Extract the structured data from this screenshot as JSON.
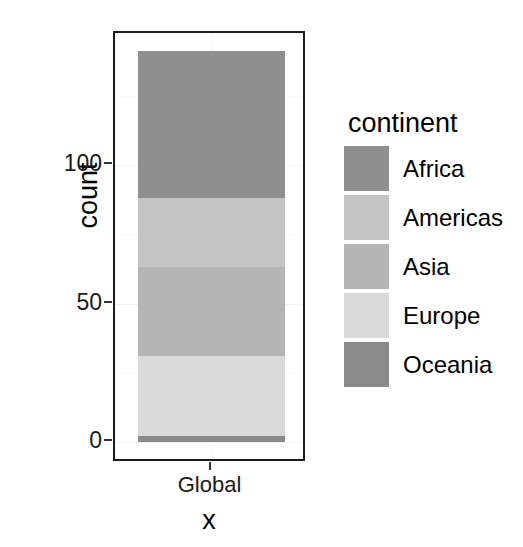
{
  "chart_data": {
    "type": "bar",
    "subtype": "stacked-bar",
    "title": "",
    "subtitle": "",
    "xlabel": "x",
    "ylabel": "count",
    "categories": [
      "Global"
    ],
    "xtick_labels": [
      "Global"
    ],
    "ytick_labels": [
      "0",
      "50",
      "100"
    ],
    "ytick_values": [
      0,
      50,
      100
    ],
    "ylim": [
      0,
      155
    ],
    "xlim_categories": 1,
    "grid": true,
    "grid_major_values": [
      0,
      50,
      100
    ],
    "grid_minor_values": [
      25,
      75,
      125
    ],
    "legend_position": "right",
    "legend_title": "continent",
    "stack_order_bottom_to_top": [
      "Oceania",
      "Europe",
      "Asia",
      "Americas",
      "Africa"
    ],
    "series": [
      {
        "name": "Africa",
        "values": [
          53
        ],
        "color": "#8f8f8f",
        "cumulative_top": 141,
        "cumulative_bottom": 88
      },
      {
        "name": "Americas",
        "values": [
          25
        ],
        "color": "#c4c4c4",
        "cumulative_top": 88,
        "cumulative_bottom": 63
      },
      {
        "name": "Asia",
        "values": [
          32
        ],
        "color": "#b5b5b5",
        "cumulative_top": 63,
        "cumulative_bottom": 31
      },
      {
        "name": "Europe",
        "values": [
          29
        ],
        "color": "#d9d9d9",
        "cumulative_top": 31,
        "cumulative_bottom": 2
      },
      {
        "name": "Oceania",
        "values": [
          2
        ],
        "color": "#8a8a8a",
        "cumulative_top": 2,
        "cumulative_bottom": 0
      }
    ],
    "total": 141
  },
  "axes": {
    "y_title": "count",
    "x_title": "x",
    "y_ticks": [
      {
        "label": "100",
        "value": 100
      },
      {
        "label": "50",
        "value": 50
      },
      {
        "label": "0",
        "value": 0
      }
    ],
    "x_ticks": [
      {
        "label": "Global"
      }
    ]
  },
  "legend": {
    "title": "continent",
    "items": [
      {
        "label": "Africa",
        "color": "#8f8f8f"
      },
      {
        "label": "Americas",
        "color": "#c4c4c4"
      },
      {
        "label": "Asia",
        "color": "#b5b5b5"
      },
      {
        "label": "Europe",
        "color": "#d9d9d9"
      },
      {
        "label": "Oceania",
        "color": "#8a8a8a"
      }
    ]
  },
  "style": {
    "panel_background": "#ffffff",
    "panel_border": "#1a1a1a",
    "grid_major_color": "#f2f2f2",
    "grid_minor_color": "#fafafa",
    "text_color": "#000000",
    "tick_color": "#333333"
  }
}
